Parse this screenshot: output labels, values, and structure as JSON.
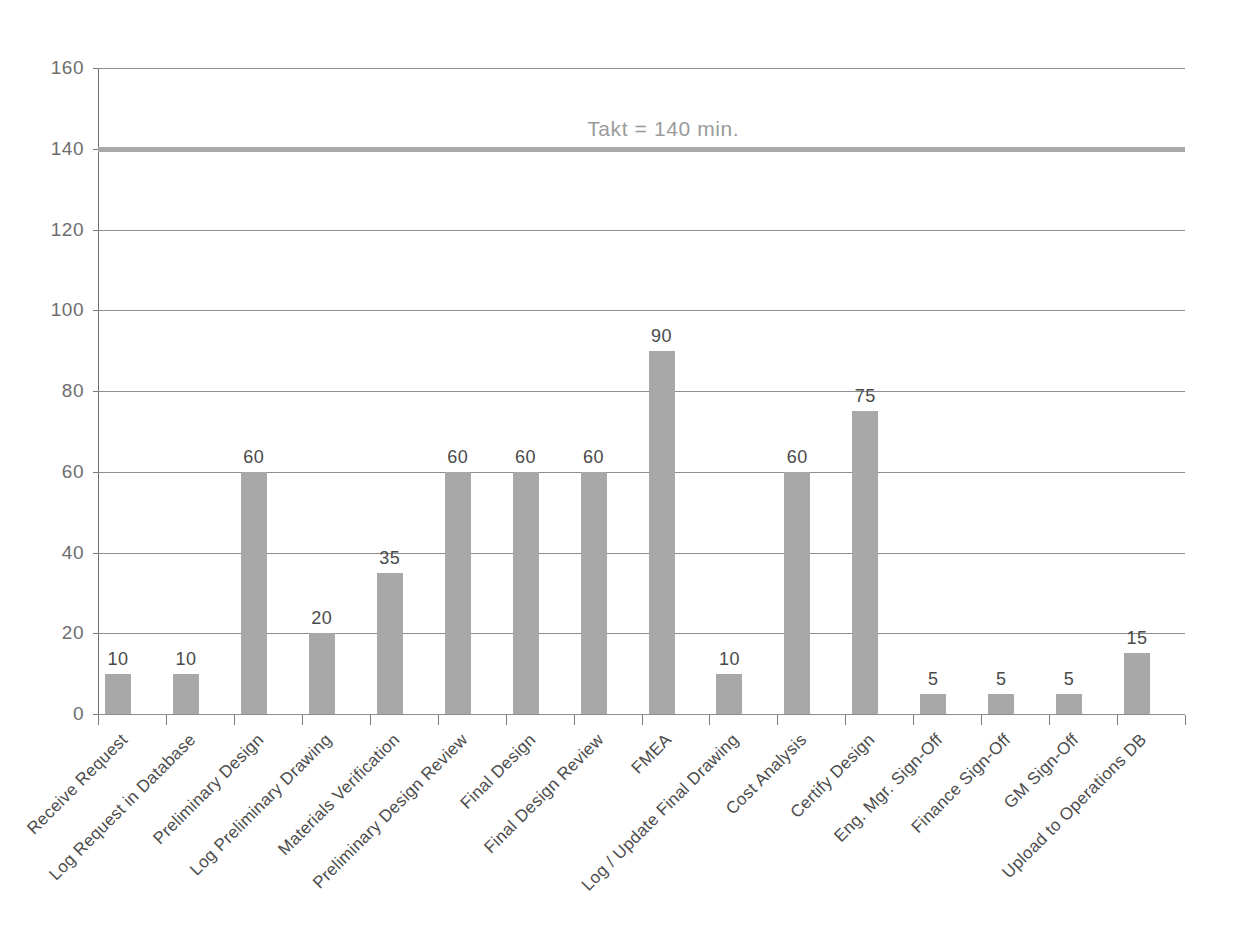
{
  "chart_data": {
    "type": "bar",
    "title": "",
    "subtitle": "",
    "xlabel": "",
    "ylabel": "",
    "ylim": [
      0,
      160
    ],
    "ytick_step": 20,
    "yticks": [
      0,
      20,
      40,
      60,
      80,
      100,
      120,
      140,
      160
    ],
    "grid": true,
    "legend": "none",
    "categories": [
      "Receive Request",
      "Log Request in Database",
      "Preliminary Design",
      "Log Preliminary Drawing",
      "Materials Verification",
      "Preliminary Design Review",
      "Final Design",
      "Final Design Review",
      "FMEA",
      "Log / Update Final Drawing",
      "Cost Analysis",
      "Certify Design",
      "Eng. Mgr. Sign-Off",
      "Finance Sign-Off",
      "GM Sign-Off",
      "Upload to Operations DB"
    ],
    "values": [
      10,
      10,
      60,
      20,
      35,
      60,
      60,
      60,
      90,
      10,
      60,
      75,
      5,
      5,
      5,
      15
    ],
    "annotations": [
      {
        "name": "takt-line",
        "type": "horizontal-line",
        "value": 140,
        "label": "Takt = 140 min."
      }
    ],
    "colors": {
      "bar": "#a8a8a8",
      "takt_line": "#a9a9a9",
      "takt_label": "#9a9a9a",
      "gridline": "#8d8d8d",
      "axis": "#7a7a7a",
      "tick_label": "#6e6e6e",
      "data_label": "#4a4a4a",
      "category_label": "#4c4c4c",
      "background": "#ffffff"
    }
  }
}
